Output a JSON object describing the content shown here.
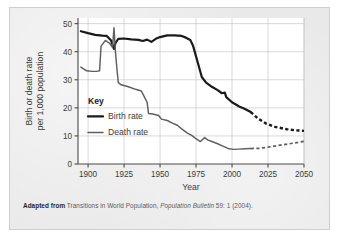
{
  "caption": {
    "lead": "Adapted from",
    "rest_1": " Transitions in World Population, ",
    "italic_part": "Population Bulletin",
    "rest_2": " 59: 1 (2004)."
  },
  "legend": {
    "title": "Key",
    "items": [
      {
        "label": "Birth rate",
        "color": "#1a1a1a",
        "width": 2.3,
        "name": "legend-birth-rate"
      },
      {
        "label": "Death rate",
        "color": "#5e5e5e",
        "width": 1.5,
        "name": "legend-death-rate"
      }
    ]
  },
  "colors": {
    "birth": "#1a1a1a",
    "death": "#5e5e5e",
    "grid": "#c9c9c9",
    "axis": "#4a4a4a",
    "plot_bg": "#ffffff",
    "figure_bg": "#e9e9e9",
    "text": "#3c3c3c"
  },
  "chart_data": {
    "type": "line",
    "title": "",
    "xlabel": "Year",
    "ylabel": "Birth or death rate per 1,000 population",
    "ylabel_line_1": "Birth or death rate",
    "ylabel_line_2": "per 1,000 population",
    "xlim": [
      1893,
      2050
    ],
    "ylim": [
      0,
      52
    ],
    "xticks": [
      1900,
      1925,
      1950,
      1975,
      2000,
      2025,
      2050
    ],
    "xtick_labels": [
      "1900",
      "1925",
      "1950",
      "1975",
      "2000",
      "2025",
      "2050"
    ],
    "yticks": [
      0,
      10,
      20,
      30,
      40,
      50
    ],
    "ytick_labels": [
      "0",
      "10",
      "20",
      "30",
      "40",
      "50"
    ],
    "grid": true,
    "legend_position": "inside-left",
    "projection_start_year": 2013,
    "series": [
      {
        "name": "Birth rate",
        "color": "#1a1a1a",
        "solid": [
          [
            1895,
            47.3
          ],
          [
            1900,
            46.6
          ],
          [
            1905,
            46.0
          ],
          [
            1910,
            45.7
          ],
          [
            1913,
            45.6
          ],
          [
            1916,
            44.0
          ],
          [
            1918,
            41.0
          ],
          [
            1919,
            43.0
          ],
          [
            1921,
            44.6
          ],
          [
            1925,
            44.7
          ],
          [
            1930,
            44.4
          ],
          [
            1935,
            44.2
          ],
          [
            1938,
            43.8
          ],
          [
            1941,
            44.3
          ],
          [
            1944,
            43.5
          ],
          [
            1947,
            44.6
          ],
          [
            1950,
            45.2
          ],
          [
            1955,
            45.8
          ],
          [
            1960,
            45.8
          ],
          [
            1965,
            45.6
          ],
          [
            1968,
            45.0
          ],
          [
            1971,
            44.2
          ],
          [
            1973,
            42.0
          ],
          [
            1976,
            36.5
          ],
          [
            1979,
            31.0
          ],
          [
            1982,
            29.0
          ],
          [
            1986,
            27.5
          ],
          [
            1990,
            26.3
          ],
          [
            1993,
            25.2
          ],
          [
            1995,
            25.4
          ],
          [
            1996,
            23.8
          ],
          [
            2000,
            22.0
          ],
          [
            2005,
            20.5
          ],
          [
            2009,
            19.6
          ],
          [
            2013,
            18.5
          ]
        ],
        "dashed": [
          [
            2013,
            18.5
          ],
          [
            2018,
            16.2
          ],
          [
            2024,
            14.3
          ],
          [
            2030,
            13.2
          ],
          [
            2038,
            12.4
          ],
          [
            2044,
            12.0
          ],
          [
            2050,
            11.8
          ]
        ]
      },
      {
        "name": "Death rate",
        "color": "#5e5e5e",
        "solid": [
          [
            1895,
            34.5
          ],
          [
            1899,
            33.2
          ],
          [
            1903,
            33.0
          ],
          [
            1906,
            33.0
          ],
          [
            1908,
            33.2
          ],
          [
            1909,
            42.0
          ],
          [
            1912,
            44.0
          ],
          [
            1915,
            43.0
          ],
          [
            1917,
            41.5
          ],
          [
            1918,
            48.5
          ],
          [
            1919,
            40.0
          ],
          [
            1920,
            34.0
          ],
          [
            1921,
            29.0
          ],
          [
            1923,
            28.2
          ],
          [
            1928,
            27.5
          ],
          [
            1933,
            26.6
          ],
          [
            1937,
            26.0
          ],
          [
            1939,
            24.0
          ],
          [
            1941,
            22.0
          ],
          [
            1942,
            18.0
          ],
          [
            1945,
            17.8
          ],
          [
            1949,
            17.3
          ],
          [
            1951,
            16.0
          ],
          [
            1955,
            15.5
          ],
          [
            1959,
            14.5
          ],
          [
            1962,
            13.8
          ],
          [
            1965,
            12.5
          ],
          [
            1969,
            11.0
          ],
          [
            1972,
            10.2
          ],
          [
            1975,
            9.0
          ],
          [
            1978,
            8.0
          ],
          [
            1981,
            9.4
          ],
          [
            1983,
            8.6
          ],
          [
            1986,
            8.0
          ],
          [
            1990,
            7.2
          ],
          [
            1994,
            6.3
          ],
          [
            1998,
            5.4
          ],
          [
            2001,
            5.2
          ],
          [
            2005,
            5.3
          ],
          [
            2009,
            5.4
          ],
          [
            2013,
            5.5
          ]
        ],
        "dashed": [
          [
            2013,
            5.5
          ],
          [
            2019,
            5.6
          ],
          [
            2025,
            6.0
          ],
          [
            2032,
            6.6
          ],
          [
            2040,
            7.2
          ],
          [
            2046,
            7.7
          ],
          [
            2050,
            8.1
          ]
        ]
      }
    ]
  }
}
